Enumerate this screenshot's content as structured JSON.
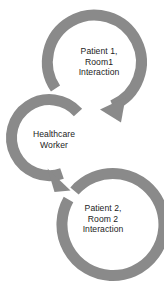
{
  "diagram": {
    "type": "cycle-diagram",
    "colors": {
      "arrow_gray": "#8a8a8a",
      "text": "#1c1c1c",
      "background": "#ffffff"
    },
    "nodes": [
      {
        "id": "patient1",
        "icon": "circular-arrow-icon",
        "lines": [
          "Patient 1,",
          "Room1",
          "Interaction"
        ],
        "line1": "Patient 1,",
        "line2": "Room1",
        "line3": "Interaction"
      },
      {
        "id": "worker",
        "icon": "circular-arrow-icon",
        "lines": [
          "Healthcare",
          "Worker"
        ],
        "line1": "Healthcare",
        "line2": "Worker"
      },
      {
        "id": "patient2",
        "icon": "circular-arrow-icon",
        "lines": [
          "Patient 2,",
          "Room 2",
          "Interaction"
        ],
        "line1": "Patient 2,",
        "line2": "Room 2",
        "line3": "Interaction"
      }
    ]
  }
}
